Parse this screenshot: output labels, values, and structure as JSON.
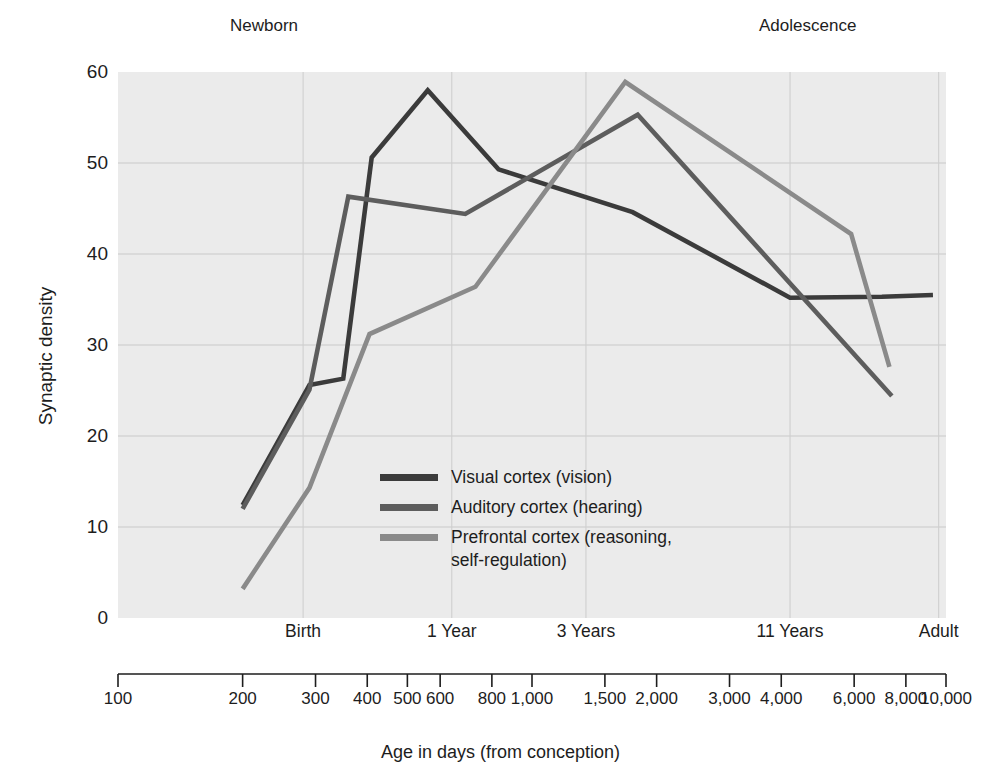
{
  "chart_data": {
    "type": "line",
    "title": "",
    "xlabel": "Age in days (from conception)",
    "ylabel": "Synaptic density",
    "xscale": "log",
    "xlim": [
      100,
      10000
    ],
    "ylim": [
      0,
      60
    ],
    "grid": true,
    "legend_position": "inside-center-lower",
    "x_tick_values": [
      100,
      200,
      300,
      400,
      500,
      600,
      800,
      1000,
      1500,
      2000,
      3000,
      4000,
      6000,
      8000,
      10000
    ],
    "x_tick_labels": [
      "100",
      "200",
      "300",
      "400",
      "500",
      "600",
      "800",
      "1,000",
      "1,500",
      "2,000",
      "3,000",
      "4,000",
      "6,000",
      "8,000",
      "10,000"
    ],
    "y_tick_values": [
      0,
      10,
      20,
      30,
      40,
      50,
      60
    ],
    "y_tick_labels": [
      "0",
      "10",
      "20",
      "30",
      "40",
      "50",
      "60"
    ],
    "stage_annotations": [
      {
        "label": "Birth",
        "x": 280
      },
      {
        "label": "1 Year",
        "x": 640
      },
      {
        "label": "3 Years",
        "x": 1350
      },
      {
        "label": "11 Years",
        "x": 4200
      },
      {
        "label": "Adult",
        "x": 9600
      }
    ],
    "era_annotations": [
      {
        "label": "Newborn",
        "x": 320
      },
      {
        "label": "Adolescence",
        "x": 5100
      }
    ],
    "series": [
      {
        "name": "Visual cortex (vision)",
        "color": "#3b3b3b",
        "points": [
          {
            "x": 200,
            "y": 12.4
          },
          {
            "x": 290,
            "y": 25.6
          },
          {
            "x": 350,
            "y": 26.3
          },
          {
            "x": 410,
            "y": 50.6
          },
          {
            "x": 560,
            "y": 58.0
          },
          {
            "x": 830,
            "y": 49.3
          },
          {
            "x": 1750,
            "y": 44.6
          },
          {
            "x": 4200,
            "y": 35.2
          },
          {
            "x": 7000,
            "y": 35.3
          },
          {
            "x": 9300,
            "y": 35.5
          }
        ]
      },
      {
        "name": "Auditory cortex (hearing)",
        "color": "#5d5d5d",
        "points": [
          {
            "x": 200,
            "y": 12.0
          },
          {
            "x": 290,
            "y": 25.1
          },
          {
            "x": 360,
            "y": 46.3
          },
          {
            "x": 690,
            "y": 44.4
          },
          {
            "x": 1800,
            "y": 55.3
          },
          {
            "x": 7400,
            "y": 24.4
          }
        ]
      },
      {
        "name": "Prefrontal cortex (reasoning, self-regulation)",
        "color": "#8a8a8a",
        "points": [
          {
            "x": 200,
            "y": 3.2
          },
          {
            "x": 290,
            "y": 14.3
          },
          {
            "x": 405,
            "y": 31.2
          },
          {
            "x": 730,
            "y": 36.4
          },
          {
            "x": 1680,
            "y": 58.9
          },
          {
            "x": 5900,
            "y": 42.2
          },
          {
            "x": 7300,
            "y": 27.6
          }
        ]
      }
    ]
  },
  "legend": {
    "items": [
      {
        "label": "Visual cortex (vision)",
        "color": "#3b3b3b"
      },
      {
        "label": "Auditory cortex (hearing)",
        "color": "#5d5d5d"
      },
      {
        "label": "Prefrontal cortex (reasoning,\nself-regulation)",
        "color": "#8a8a8a"
      }
    ]
  },
  "page_bleed_text": "and bright colours and new the early years of a child's brain by allowing it to become more efficient at producing synaptic reorganization the importance of early experience is that the connections that are used most often become stronger and more permanent while those used rarely are trimmed away in the process known as synaptic pruning which continues through adolescence and into early adulthood and is shaped by the environment the child encounters each day. Later in development the brain continues to refine its circuits and the pathways that support reasoning planning and self regulation mature last which helps to explain why adolescents may act impulsively even when they understand the risks involved in their decisions at that moment in time."
}
